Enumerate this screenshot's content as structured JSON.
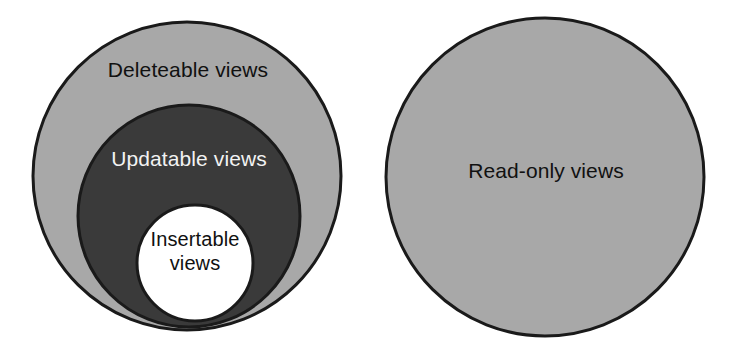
{
  "diagram": {
    "background_color": "#ffffff",
    "outline_color": "#1a1a1a",
    "colors": {
      "light_gray": "#a8a8a8",
      "dark_gray": "#3a3a3a",
      "white": "#ffffff",
      "dark_text": "#111111",
      "light_text": "#f2f2f2"
    },
    "groups": [
      {
        "name": "nested-views-group",
        "circles": [
          {
            "name": "deleteable-views-circle",
            "label": "Deleteable views",
            "fill": "#a8a8a8",
            "text_color": "#111111",
            "cx": 187,
            "cy": 176,
            "r": 154
          },
          {
            "name": "updatable-views-circle",
            "label": "Updatable views",
            "fill": "#3a3a3a",
            "text_color": "#f2f2f2",
            "cx": 189,
            "cy": 216,
            "r": 111
          },
          {
            "name": "insertable-views-circle",
            "label": "Insertable\nviews",
            "fill": "#ffffff",
            "text_color": "#111111",
            "cx": 195,
            "cy": 263,
            "r": 58
          }
        ]
      },
      {
        "name": "standalone-views-group",
        "circles": [
          {
            "name": "read-only-views-circle",
            "label": "Read-only views",
            "fill": "#a8a8a8",
            "text_color": "#111111",
            "cx": 545,
            "cy": 177,
            "r": 159
          }
        ]
      }
    ]
  }
}
